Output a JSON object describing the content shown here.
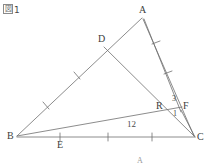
{
  "figure": {
    "caption_prefix": "図",
    "caption_number": "1",
    "background_color": "#ffffff",
    "stroke_color": "#6e6e6e",
    "label_color": "#3d3d3d"
  },
  "vertices": {
    "A": {
      "label": "A",
      "x": 142,
      "y": 14
    },
    "B": {
      "label": "B",
      "x": 13,
      "y": 137
    },
    "C": {
      "label": "C",
      "x": 196,
      "y": 138
    },
    "D": {
      "label": "D",
      "x": 104,
      "y": 42
    },
    "E": {
      "label": "E",
      "x": 60,
      "y": 143
    },
    "F": {
      "label": "F",
      "x": 179,
      "y": 108
    },
    "R": {
      "label": "R",
      "x": 161,
      "y": 107
    }
  },
  "angle_labels": [
    {
      "name": "angle-3",
      "text": "3",
      "x": 172,
      "y": 99
    },
    {
      "name": "angle-1",
      "text": "1",
      "x": 172,
      "y": 113
    }
  ],
  "segment_labels": [
    {
      "name": "segment-bc-length",
      "text": "12",
      "x": 129,
      "y": 125
    }
  ],
  "next_figure_hint": {
    "text": "A",
    "x": 138,
    "y": 158
  },
  "segments": [
    {
      "name": "segment-ab",
      "from": "A",
      "to": "B"
    },
    {
      "name": "segment-bc",
      "from": "B",
      "to": "C"
    },
    {
      "name": "segment-ac",
      "from": "A",
      "to": "C"
    },
    {
      "name": "segment-dc",
      "from": "D",
      "to": "C"
    },
    {
      "name": "segment-af",
      "from": "A",
      "to": "F"
    },
    {
      "name": "segment-br",
      "from": "B",
      "to": "R"
    },
    {
      "name": "segment-fc",
      "from": "F",
      "to": "C"
    }
  ],
  "tick_marks": {
    "segment_ab": {
      "count": 2,
      "marks": "single"
    },
    "segment_bc": {
      "count": 3,
      "marks": "single"
    },
    "segment_ac": {
      "count": 1,
      "marks": "single"
    },
    "segment_af": {
      "count": 1,
      "marks": "single"
    }
  }
}
